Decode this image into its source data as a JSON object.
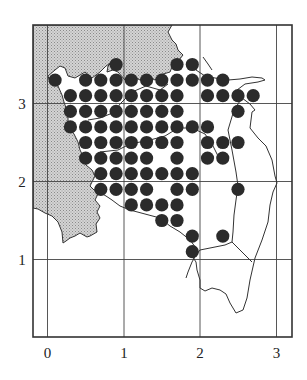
{
  "chart_data": {
    "type": "scatter",
    "title": "",
    "xlabel": "",
    "ylabel": "",
    "xlim": [
      -0.2,
      3.2
    ],
    "ylim": [
      0,
      4.0
    ],
    "grid": true,
    "legend": null,
    "x_ticks": [
      0,
      1,
      2,
      3
    ],
    "y_ticks": [
      1,
      2,
      3
    ],
    "x_tick_labels": [
      "0",
      "1",
      "2",
      "3"
    ],
    "y_tick_labels": [
      "1",
      "2",
      "3"
    ],
    "series": [
      {
        "name": "occurrence",
        "marker": "filled-circle",
        "color": "#2b2b2b",
        "points": [
          [
            0.9,
            3.5
          ],
          [
            1.7,
            3.5
          ],
          [
            1.9,
            3.5
          ],
          [
            0.1,
            3.3
          ],
          [
            0.5,
            3.3
          ],
          [
            0.7,
            3.3
          ],
          [
            0.9,
            3.3
          ],
          [
            1.1,
            3.3
          ],
          [
            1.3,
            3.3
          ],
          [
            1.5,
            3.3
          ],
          [
            1.7,
            3.3
          ],
          [
            1.9,
            3.3
          ],
          [
            2.1,
            3.3
          ],
          [
            2.3,
            3.3
          ],
          [
            0.3,
            3.1
          ],
          [
            0.5,
            3.1
          ],
          [
            0.7,
            3.1
          ],
          [
            0.9,
            3.1
          ],
          [
            1.1,
            3.1
          ],
          [
            1.3,
            3.1
          ],
          [
            1.5,
            3.1
          ],
          [
            1.7,
            3.1
          ],
          [
            2.1,
            3.1
          ],
          [
            2.3,
            3.1
          ],
          [
            2.5,
            3.1
          ],
          [
            2.7,
            3.1
          ],
          [
            0.3,
            2.9
          ],
          [
            0.5,
            2.9
          ],
          [
            0.7,
            2.9
          ],
          [
            0.9,
            2.9
          ],
          [
            1.1,
            2.9
          ],
          [
            1.3,
            2.9
          ],
          [
            1.5,
            2.9
          ],
          [
            1.7,
            2.9
          ],
          [
            2.5,
            2.9
          ],
          [
            0.3,
            2.7
          ],
          [
            0.5,
            2.7
          ],
          [
            0.7,
            2.7
          ],
          [
            0.9,
            2.7
          ],
          [
            1.1,
            2.7
          ],
          [
            1.3,
            2.7
          ],
          [
            1.5,
            2.7
          ],
          [
            1.7,
            2.7
          ],
          [
            1.9,
            2.7
          ],
          [
            2.1,
            2.7
          ],
          [
            0.5,
            2.5
          ],
          [
            0.7,
            2.5
          ],
          [
            0.9,
            2.5
          ],
          [
            1.1,
            2.5
          ],
          [
            1.3,
            2.5
          ],
          [
            1.5,
            2.5
          ],
          [
            1.7,
            2.5
          ],
          [
            2.1,
            2.5
          ],
          [
            2.3,
            2.5
          ],
          [
            2.5,
            2.5
          ],
          [
            0.5,
            2.3
          ],
          [
            0.7,
            2.3
          ],
          [
            0.9,
            2.3
          ],
          [
            1.1,
            2.3
          ],
          [
            1.3,
            2.3
          ],
          [
            1.7,
            2.3
          ],
          [
            2.1,
            2.3
          ],
          [
            2.3,
            2.3
          ],
          [
            0.7,
            2.1
          ],
          [
            0.9,
            2.1
          ],
          [
            1.1,
            2.1
          ],
          [
            1.3,
            2.1
          ],
          [
            1.5,
            2.1
          ],
          [
            1.7,
            2.1
          ],
          [
            1.9,
            2.1
          ],
          [
            0.7,
            1.9
          ],
          [
            0.9,
            1.9
          ],
          [
            1.1,
            1.9
          ],
          [
            1.3,
            1.9
          ],
          [
            1.7,
            1.9
          ],
          [
            1.9,
            1.9
          ],
          [
            2.5,
            1.9
          ],
          [
            1.1,
            1.7
          ],
          [
            1.3,
            1.7
          ],
          [
            1.5,
            1.7
          ],
          [
            1.7,
            1.7
          ],
          [
            1.5,
            1.5
          ],
          [
            1.7,
            1.5
          ],
          [
            1.9,
            1.3
          ],
          [
            2.3,
            1.3
          ],
          [
            1.9,
            1.1
          ]
        ]
      }
    ]
  },
  "colors": {
    "background": "#ffffff",
    "frame": "#333333",
    "grid": "#444444",
    "shaded_region": "#c9c9c9",
    "coastline": "#333333",
    "dot": "#2b2b2b"
  }
}
